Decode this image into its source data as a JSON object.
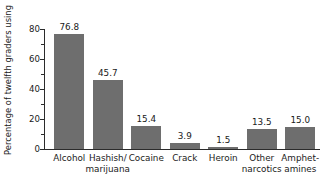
{
  "chart_data": {
    "type": "bar",
    "title": "",
    "xlabel": "",
    "ylabel": "Percentage of twelfth graders using",
    "ylim": [
      0,
      85
    ],
    "grid": false,
    "legend": null,
    "y_major_ticks": [
      0,
      20,
      40,
      60,
      80
    ],
    "y_minor_ticks": [
      10,
      30,
      50,
      70
    ],
    "y_tick_labels": [
      "0",
      "20",
      "40",
      "60",
      "80"
    ],
    "categories": [
      "Alcohol",
      "Hashish/ marijuana",
      "Cocaine",
      "Crack",
      "Heroin",
      "Other narcotics",
      "Amphet- amines"
    ],
    "category_lines": [
      [
        "Alcohol",
        ""
      ],
      [
        "Hashish/",
        "marijuana"
      ],
      [
        "Cocaine",
        ""
      ],
      [
        "Crack",
        ""
      ],
      [
        "Heroin",
        ""
      ],
      [
        "Other",
        "narcotics"
      ],
      [
        "Amphet-",
        "amines"
      ]
    ],
    "values": [
      76.8,
      45.7,
      15.4,
      3.9,
      1.5,
      13.5,
      15.0
    ],
    "value_labels": [
      "76.8",
      "45.7",
      "15.4",
      "3.9",
      "1.5",
      "13.5",
      "15.0"
    ],
    "bar_color": "#6e6e6e",
    "axis_color": "#2b2b2b",
    "background": "#ffffff"
  }
}
